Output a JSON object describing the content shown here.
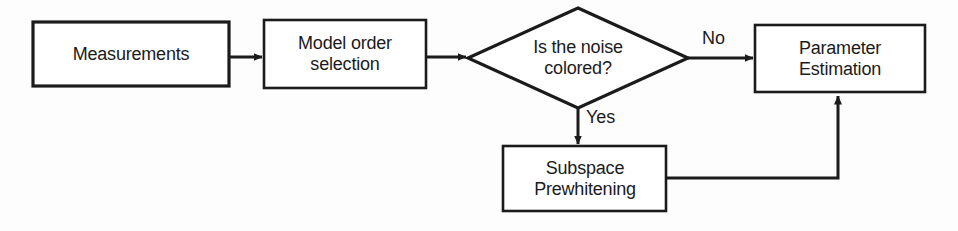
{
  "diagram": {
    "type": "flowchart",
    "stroke_color": "#1b1b1b",
    "fill_color": "#ffffff",
    "background_color": "#fdfdfd",
    "nodes": [
      {
        "id": "measurements",
        "shape": "rectangle",
        "label": "Measurements",
        "x": 33,
        "y": 22,
        "width": 196,
        "height": 64
      },
      {
        "id": "model-order-selection",
        "shape": "rectangle",
        "label": "Model order\nselection",
        "line1": "Model order",
        "line2": "selection",
        "x": 264,
        "y": 20,
        "width": 162,
        "height": 68
      },
      {
        "id": "noise-decision",
        "shape": "diamond",
        "label": "Is the noise\ncolored?",
        "line1": "Is the noise",
        "line2": "colored?",
        "x": 468,
        "y": 8,
        "width": 220,
        "height": 100
      },
      {
        "id": "parameter-estimation",
        "shape": "rectangle",
        "label": "Parameter\nEstimation",
        "line1": "Parameter",
        "line2": "Estimation",
        "x": 755,
        "y": 25,
        "width": 170,
        "height": 67
      },
      {
        "id": "subspace-prewhitening",
        "shape": "rectangle",
        "label": "Subspace\nPrewhitening",
        "line1": "Subspace",
        "line2": "Prewhitening",
        "x": 503,
        "y": 146,
        "width": 163,
        "height": 65
      }
    ],
    "edges": [
      {
        "id": "measurements-to-model-order",
        "from": "measurements",
        "to": "model-order-selection",
        "label": "",
        "direction": "right"
      },
      {
        "id": "model-order-to-decision",
        "from": "model-order-selection",
        "to": "noise-decision",
        "label": "",
        "direction": "right"
      },
      {
        "id": "decision-no-to-parameter-estimation",
        "from": "noise-decision",
        "to": "parameter-estimation",
        "label": "No",
        "direction": "right"
      },
      {
        "id": "decision-yes-to-subspace",
        "from": "noise-decision",
        "to": "subspace-prewhitening",
        "label": "Yes",
        "direction": "down"
      },
      {
        "id": "subspace-to-parameter-estimation",
        "from": "subspace-prewhitening",
        "to": "parameter-estimation",
        "label": "",
        "direction": "right-then-up"
      }
    ]
  },
  "background_ghost_text": {
    "note": "faint scanned bleed-through from the reverse page, largely illegible",
    "lines": [
      "",
      "",
      "",
      "",
      "",
      ""
    ]
  }
}
